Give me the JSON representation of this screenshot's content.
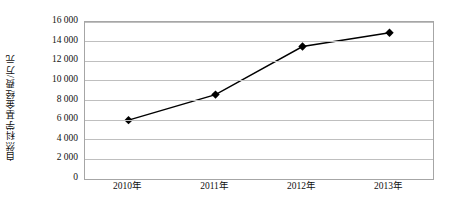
{
  "chart_data": {
    "type": "line",
    "title": "",
    "xlabel": "",
    "ylabel": "自然科学基金经费/万元",
    "categories": [
      "2010年",
      "2011年",
      "2012年",
      "2013年"
    ],
    "series": [
      {
        "name": "自然科学基金经费",
        "values": [
          6000,
          8600,
          13500,
          14900
        ],
        "marker": "diamond",
        "line_color": "#000000",
        "marker_color": "#000000"
      }
    ],
    "ylim": [
      0,
      16000
    ],
    "yticks": [
      0,
      2000,
      4000,
      6000,
      8000,
      10000,
      12000,
      14000,
      16000
    ],
    "ytick_labels": [
      "0",
      "2 000",
      "4 000",
      "6 000",
      "8 000",
      "10 000",
      "12 000",
      "14 000",
      "16 000"
    ],
    "grid": true,
    "grid_color": "#bfbfbf",
    "legend": false,
    "legend_position": "none",
    "plot_border_color": "#a6a6a6",
    "background_color": "#ffffff"
  }
}
